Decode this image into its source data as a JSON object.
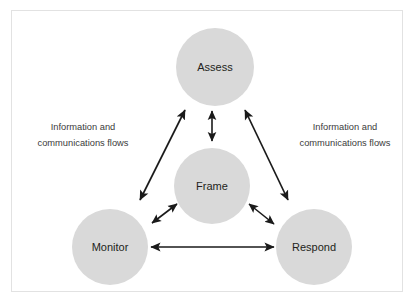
{
  "figure": {
    "border_color": "#e2e2e2",
    "background_color": "#ffffff"
  },
  "nodes": [
    {
      "id": "assess",
      "label": "Assess",
      "cx": 215,
      "cy": 67,
      "r": 39,
      "fill": "#d9d9d9"
    },
    {
      "id": "frame",
      "label": "Frame",
      "cx": 212,
      "cy": 186,
      "r": 38,
      "fill": "#d9d9d9"
    },
    {
      "id": "monitor",
      "label": "Monitor",
      "cx": 110,
      "cy": 247,
      "r": 38,
      "fill": "#d9d9d9"
    },
    {
      "id": "respond",
      "label": "Respond",
      "cx": 314,
      "cy": 247,
      "r": 38,
      "fill": "#d9d9d9"
    }
  ],
  "labels": {
    "left_flow": {
      "line1": "Information and",
      "line2": "communications flows",
      "x": 83,
      "y1": 130,
      "y2": 146
    },
    "right_flow": {
      "line1": "Information and",
      "line2": "communications flows",
      "x": 345,
      "y1": 130,
      "y2": 146
    }
  },
  "connectors": [
    {
      "id": "assess-frame",
      "from": "assess",
      "to": "frame",
      "style": "double-arrow",
      "orientation": "vertical"
    },
    {
      "id": "monitor-assess",
      "from": "monitor",
      "to": "assess",
      "style": "double-arrow",
      "orientation": "diagonal-left"
    },
    {
      "id": "assess-respond",
      "from": "assess",
      "to": "respond",
      "style": "double-arrow",
      "orientation": "diagonal-right"
    },
    {
      "id": "frame-monitor",
      "from": "frame",
      "to": "monitor",
      "style": "double-arrow",
      "orientation": "diagonal-short-left"
    },
    {
      "id": "frame-respond",
      "from": "frame",
      "to": "respond",
      "style": "double-arrow",
      "orientation": "diagonal-short-right"
    },
    {
      "id": "monitor-respond",
      "from": "monitor",
      "to": "respond",
      "style": "double-arrow",
      "orientation": "horizontal"
    }
  ],
  "colors": {
    "node_fill": "#d9d9d9",
    "connector": "#1a1a1a",
    "node_text": "#231f20",
    "flow_text": "#3b3b3b"
  }
}
